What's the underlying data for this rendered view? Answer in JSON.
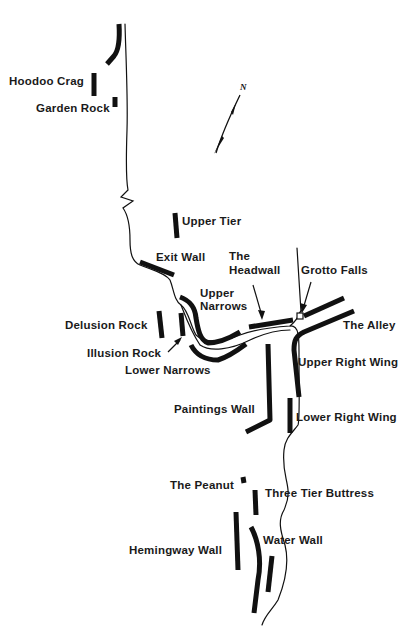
{
  "map": {
    "title": "",
    "north_arrow": {
      "label": "N"
    },
    "labels": [
      {
        "id": "hoodoo-crag",
        "text": "Hoodoo Crag",
        "x": 9,
        "y": 75
      },
      {
        "id": "garden-rock",
        "text": "Garden Rock",
        "x": 36,
        "y": 102
      },
      {
        "id": "upper-tier",
        "text": "Upper Tier",
        "x": 181,
        "y": 215
      },
      {
        "id": "exit-wall",
        "text": "Exit Wall",
        "x": 155,
        "y": 251
      },
      {
        "id": "the-headwall-1",
        "text": "The",
        "x": 229,
        "y": 250
      },
      {
        "id": "the-headwall-2",
        "text": "Headwall",
        "x": 229,
        "y": 264
      },
      {
        "id": "grotto-falls",
        "text": "Grotto Falls",
        "x": 300,
        "y": 263
      },
      {
        "id": "upper-narrows-1",
        "text": "Upper",
        "x": 199,
        "y": 286
      },
      {
        "id": "upper-narrows-2",
        "text": "Narrows",
        "x": 199,
        "y": 300
      },
      {
        "id": "delusion-rock",
        "text": "Delusion Rock",
        "x": 65,
        "y": 319
      },
      {
        "id": "the-alley",
        "text": "The Alley",
        "x": 343,
        "y": 319
      },
      {
        "id": "illusion-rock",
        "text": "Illusion Rock",
        "x": 87,
        "y": 347
      },
      {
        "id": "upper-right-wing",
        "text": "Upper Right Wing",
        "x": 298,
        "y": 356
      },
      {
        "id": "lower-narrows",
        "text": "Lower Narrows",
        "x": 125,
        "y": 364
      },
      {
        "id": "paintings-wall",
        "text": "Paintings Wall",
        "x": 174,
        "y": 403
      },
      {
        "id": "lower-right-wing",
        "text": "Lower Right Wing",
        "x": 296,
        "y": 411
      },
      {
        "id": "the-peanut",
        "text": "The Peanut",
        "x": 170,
        "y": 479
      },
      {
        "id": "three-tier-buttress",
        "text": "Three Tier Buttress",
        "x": 265,
        "y": 487
      },
      {
        "id": "water-wall",
        "text": "Water Wall",
        "x": 263,
        "y": 534
      },
      {
        "id": "hemingway-wall",
        "text": "Hemingway Wall",
        "x": 129,
        "y": 544
      }
    ]
  }
}
